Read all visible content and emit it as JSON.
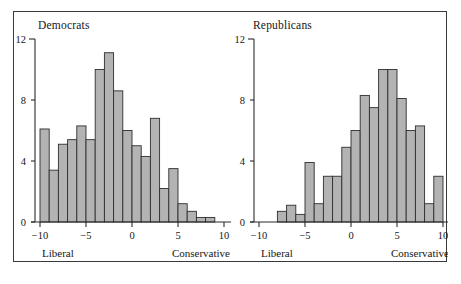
{
  "figure": {
    "background": "#ffffff",
    "frame_color": "#3a3a3a",
    "bar_fill": "#b3b3b3",
    "bar_stroke": "#2e2e2e",
    "axis_color": "#2b2b2b"
  },
  "chart_data": [
    {
      "type": "bar",
      "title": "Democrats",
      "xlabel": "",
      "ylabel": "",
      "xlim": [
        -10,
        10
      ],
      "ylim": [
        0,
        12
      ],
      "grid": false,
      "legend": null,
      "xticks": [
        -10,
        -5,
        0,
        5,
        10
      ],
      "xtick_labels": [
        "−10",
        "−5",
        "0",
        "5",
        "10"
      ],
      "yticks": [
        0,
        4,
        8,
        12
      ],
      "ytick_labels": [
        "0",
        "4",
        "8",
        "12"
      ],
      "axis_end_labels": {
        "left": "Liberal",
        "right": "Conservative"
      },
      "bin_width": 1,
      "bin_starts": [
        -10,
        -9,
        -8,
        -7,
        -6,
        -5,
        -4,
        -3,
        -2,
        -1,
        0,
        1,
        2,
        3,
        4,
        5,
        6,
        7,
        8
      ],
      "values": [
        6.1,
        3.4,
        5.1,
        5.4,
        6.3,
        5.4,
        10.0,
        11.1,
        8.6,
        6.0,
        5.0,
        4.3,
        6.8,
        2.2,
        3.5,
        1.2,
        0.7,
        0.3,
        0.3
      ]
    },
    {
      "type": "bar",
      "title": "Republicans",
      "xlabel": "",
      "ylabel": "",
      "xlim": [
        -10,
        10
      ],
      "ylim": [
        0,
        12
      ],
      "grid": false,
      "legend": null,
      "xticks": [
        -10,
        -5,
        0,
        5,
        10
      ],
      "xtick_labels": [
        "−10",
        "−5",
        "0",
        "5",
        "10"
      ],
      "yticks": [
        0,
        4,
        8,
        12
      ],
      "ytick_labels": [
        "0",
        "4",
        "8",
        "12"
      ],
      "axis_end_labels": {
        "left": "Liberal",
        "right": "Conservative"
      },
      "bin_width": 1,
      "bin_starts": [
        -8,
        -7,
        -6,
        -5,
        -4,
        -3,
        -2,
        -1,
        0,
        1,
        2,
        3,
        4,
        5,
        6,
        7,
        8,
        9
      ],
      "values": [
        0.7,
        1.1,
        0.5,
        3.9,
        1.2,
        3.0,
        3.0,
        4.9,
        6.0,
        8.3,
        7.5,
        10.0,
        10.0,
        8.1,
        6.0,
        6.3,
        1.2,
        3.0
      ]
    }
  ]
}
